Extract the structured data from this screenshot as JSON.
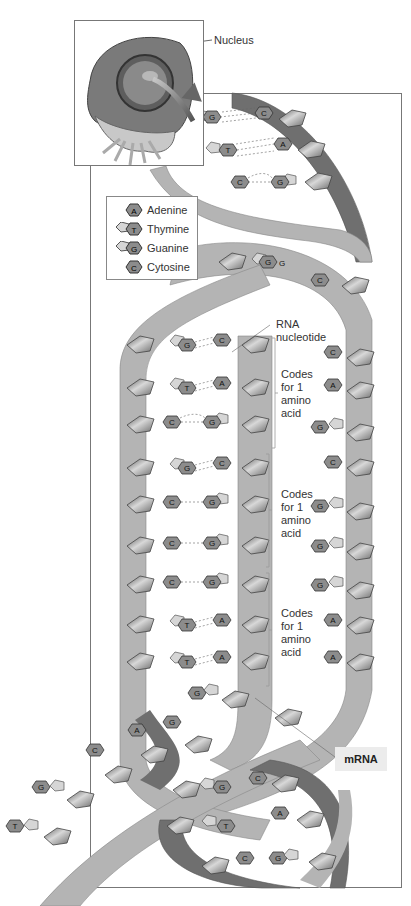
{
  "figure": {
    "header_fragment": "",
    "cell_callout": {
      "label": "Nucleus"
    },
    "legend": {
      "items": [
        {
          "code": "A",
          "name": "Adenine",
          "shape": "hexagon"
        },
        {
          "code": "T",
          "name": "Thymine",
          "shape": "pentagon+hexagon"
        },
        {
          "code": "G",
          "name": "Guanine",
          "shape": "pentagon+hexagon"
        },
        {
          "code": "C",
          "name": "Cytosine",
          "shape": "hexagon"
        }
      ]
    },
    "labels": {
      "rna_nucleotide": "RNA nucleotide",
      "rna_line1": "RNA",
      "rna_line2": "nucleotide",
      "mrna": "mRNA",
      "codons": [
        {
          "l1": "Codes",
          "l2": "for 1",
          "l3": "amino",
          "l4": "acid"
        },
        {
          "l1": "Codes",
          "l2": "for 1",
          "l3": "amino",
          "l4": "acid"
        },
        {
          "l1": "Codes",
          "l2": "for 1",
          "l3": "amino",
          "l4": "acid"
        }
      ]
    },
    "top_helix_pairs": [
      {
        "left": "G",
        "right": "C"
      },
      {
        "left": "T",
        "right": "A"
      },
      {
        "left": "C",
        "right": "G"
      }
    ],
    "template_pairs": [
      {
        "dna": "G",
        "rna": "C"
      },
      {
        "dna": "T",
        "rna": "A"
      },
      {
        "dna": "C",
        "rna": "G"
      },
      {
        "dna": "G",
        "rna": "C"
      },
      {
        "dna": "C",
        "rna": "G"
      },
      {
        "dna": "C",
        "rna": "G"
      },
      {
        "dna": "C",
        "rna": "G"
      },
      {
        "dna": "T",
        "rna": "A"
      },
      {
        "dna": "T",
        "rna": "A"
      }
    ],
    "coding_strand_bases": [
      "C",
      "C",
      "A",
      "G",
      "C",
      "G",
      "G",
      "G",
      "A",
      "A"
    ],
    "unwound_strand_bases": [
      "G",
      "G",
      "A",
      "C",
      "G",
      "T"
    ],
    "bottom_helix_pairs": [
      {
        "left": "G",
        "right": "C"
      },
      {
        "left": "T",
        "right": "A"
      },
      {
        "left": "C",
        "right": "G"
      }
    ],
    "colors": {
      "backbone_light": "#b4b4b4",
      "backbone_dark": "#6f6f6f",
      "base_fill": "#8a8a8a",
      "sugar_fill": "#9a9a9a",
      "frame": "#777777"
    }
  }
}
